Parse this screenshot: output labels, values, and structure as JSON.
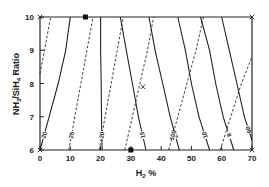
{
  "chart_data": {
    "type": "line",
    "title": "",
    "xlabel": "H2 %",
    "xlabel_main": "H",
    "xlabel_sub": "2",
    "xlabel_suffix": " %",
    "ylabel": "NH3/SiH4 Ratio",
    "ylabel_parts": [
      "NH",
      "3",
      "/SiH",
      "4",
      " Ratio"
    ],
    "xlim": [
      0,
      70
    ],
    "ylim": [
      6,
      10
    ],
    "x_ticks": [
      "0",
      "10",
      "20",
      "30",
      "40",
      "50",
      "60",
      "70"
    ],
    "y_ticks": [
      "6",
      "7",
      "8",
      "9",
      "10"
    ],
    "grid": false,
    "legend": "none",
    "series": [
      {
        "name": "solid-20",
        "style": "solid",
        "label": "20",
        "points": [
          [
            0,
            6.0
          ],
          [
            3,
            7.0
          ],
          [
            6,
            8.0
          ],
          [
            8.5,
            9.0
          ],
          [
            10,
            10.0
          ]
        ]
      },
      {
        "name": "solid-25",
        "style": "solid",
        "label": "25",
        "points": [
          [
            20.5,
            6.0
          ],
          [
            20.3,
            7.0
          ],
          [
            20.2,
            8.0
          ],
          [
            20,
            9.0
          ],
          [
            20,
            10.0
          ]
        ]
      },
      {
        "name": "solid-15",
        "style": "solid",
        "label": "15",
        "points": [
          [
            35,
            6.0
          ],
          [
            32.5,
            7.0
          ],
          [
            30.5,
            8.0
          ],
          [
            28.5,
            9.0
          ],
          [
            26.5,
            10.0
          ]
        ]
      },
      {
        "name": "solid-24",
        "style": "solid",
        "label": "24",
        "points": [
          [
            46,
            6.0
          ],
          [
            43,
            7.0
          ],
          [
            40.5,
            8.0
          ],
          [
            38,
            9.0
          ],
          [
            36,
            10.0
          ]
        ]
      },
      {
        "name": "solid-10",
        "style": "solid",
        "label": "10",
        "points": [
          [
            56,
            6.0
          ],
          [
            52.5,
            7.0
          ],
          [
            50,
            8.0
          ],
          [
            48,
            9.0
          ],
          [
            45.5,
            10.0
          ]
        ]
      },
      {
        "name": "solid-8",
        "style": "solid",
        "label": "8",
        "points": [
          [
            64,
            6.0
          ],
          [
            60.5,
            7.0
          ],
          [
            58,
            8.0
          ],
          [
            56,
            9.0
          ],
          [
            53,
            10.0
          ]
        ]
      },
      {
        "name": "solid-60",
        "style": "solid",
        "label": "60",
        "points": [
          [
            70,
            6.3
          ],
          [
            67.5,
            7.0
          ],
          [
            65,
            8.0
          ],
          [
            62.5,
            9.0
          ],
          [
            60,
            10.0
          ]
        ]
      },
      {
        "name": "dashed-25",
        "style": "dashed",
        "label": "25",
        "points": [
          [
            9.5,
            6.0
          ],
          [
            11.5,
            7.0
          ],
          [
            13.5,
            8.0
          ],
          [
            15.5,
            9.0
          ],
          [
            17.5,
            10.0
          ]
        ]
      },
      {
        "name": "dashed-20",
        "style": "dashed",
        "label": "20",
        "points": [
          [
            19.5,
            6.0
          ],
          [
            21.5,
            7.0
          ],
          [
            23.5,
            8.0
          ],
          [
            25.5,
            9.0
          ],
          [
            27.5,
            10.0
          ]
        ]
      },
      {
        "name": "dashed-a",
        "style": "dashed",
        "label": "",
        "points": [
          [
            0,
            8.3
          ],
          [
            1.5,
            9.0
          ],
          [
            3.5,
            10.0
          ]
        ]
      },
      {
        "name": "dashed-b",
        "style": "dashed",
        "label": "",
        "points": [
          [
            28,
            6.0
          ],
          [
            30.5,
            7.0
          ],
          [
            33,
            8.0
          ],
          [
            35.5,
            9.0
          ],
          [
            37.5,
            10.0
          ]
        ]
      },
      {
        "name": "dashed-100",
        "style": "dashed",
        "label": "100",
        "points": [
          [
            42.5,
            6.0
          ],
          [
            45.5,
            7.0
          ],
          [
            48.5,
            8.0
          ],
          [
            51.5,
            9.0
          ],
          [
            54,
            10.0
          ]
        ]
      },
      {
        "name": "dashed-c",
        "style": "dashed",
        "label": "",
        "points": [
          [
            59.5,
            6.0
          ],
          [
            63,
            7.0
          ],
          [
            66.5,
            8.0
          ],
          [
            70,
            8.8
          ]
        ]
      }
    ],
    "markers": [
      {
        "type": "filled-square",
        "x": 15,
        "y": 10
      },
      {
        "type": "filled-square",
        "x": 30,
        "y": 6
      },
      {
        "type": "cross",
        "x": 0,
        "y": 10
      },
      {
        "type": "cross",
        "x": 70,
        "y": 10
      },
      {
        "type": "cross",
        "x": 34,
        "y": 7.9
      },
      {
        "type": "cross",
        "x": 0,
        "y": 6
      },
      {
        "type": "cross",
        "x": 70,
        "y": 6
      }
    ]
  }
}
